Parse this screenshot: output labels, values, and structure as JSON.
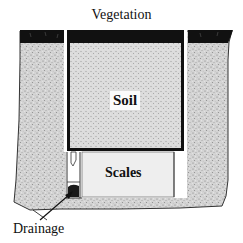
{
  "diagram": {
    "type": "lysimeter-cross-section",
    "labels": {
      "vegetation": "Vegetation",
      "soil": "Soil",
      "scales": "Scales",
      "drainage": "Drainage"
    },
    "colors": {
      "background": "#ffffff",
      "vegetation_layer": "#111111",
      "soil_fill": "#cfcfcf",
      "soil_speckle": "#8a8a8a",
      "container_wall": "#111111",
      "scales_chamber": "#eeeeee",
      "drain_blob": "#1a1a1a",
      "outline": "#333333"
    }
  }
}
